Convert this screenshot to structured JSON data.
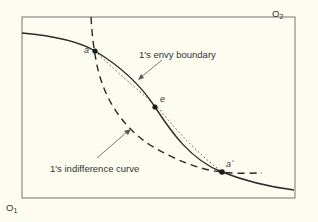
{
  "diagram": {
    "type": "edgeworth-box",
    "origins": {
      "o1": {
        "base": "O",
        "sub": "1"
      },
      "o2": {
        "base": "O",
        "sub": "2"
      }
    },
    "curves": {
      "envy_boundary": {
        "label": "1's envy boundary",
        "style": "solid"
      },
      "indifference_curve": {
        "label": "1's indifference curve",
        "style": "dashed"
      },
      "chord": {
        "style": "dotted"
      }
    },
    "points": {
      "a": "a",
      "e": "e",
      "a_prime": "a´"
    },
    "colors": {
      "background": "#fcfcf0",
      "line": "#2a2a2a",
      "frame": "#666666"
    }
  }
}
